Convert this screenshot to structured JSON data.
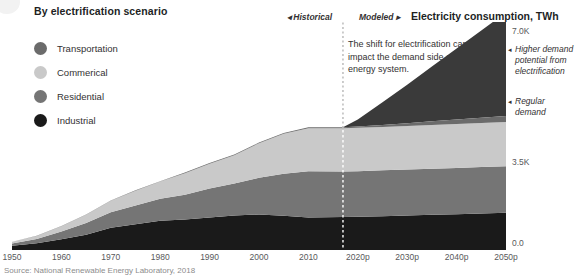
{
  "legend": {
    "title": "By electrification scenario",
    "items": [
      {
        "label": "Transportation",
        "color": "#6b6b6b"
      },
      {
        "label": "Commerical",
        "color": "#c9c9c9"
      },
      {
        "label": "Residential",
        "color": "#757575"
      },
      {
        "label": "Industrial",
        "color": "#1a1a1a"
      }
    ]
  },
  "periods": {
    "historical": "◂ Historical",
    "modeled": "Modeled ▸"
  },
  "chart_title": "Electricity consumption, TWh",
  "callout": "The shift for electrification can impact the demand side of the U.S. energy system.",
  "annotations": {
    "higher_arrow": "◂",
    "higher": "Higher demand potential from electrification",
    "regular_arrow": "◂",
    "regular": "Regular demand"
  },
  "source": "Source: National Renewable Energy Laboratory, 2018",
  "chart_data": {
    "type": "area",
    "title": "Electricity consumption, TWh",
    "xlabel": "",
    "ylabel": "Electricity consumption, TWh",
    "ylim": [
      0,
      7000
    ],
    "xlim": [
      1950,
      2050
    ],
    "grid": false,
    "legend_position": "top-left",
    "ytick_labels": [
      "0.0",
      "3.5K",
      "7.0K"
    ],
    "ytick_values": [
      0,
      3500,
      7000
    ],
    "xtick_labels": [
      "1950",
      "1960",
      "1970",
      "1980",
      "1990",
      "2000",
      "2010",
      "2020p",
      "2030p",
      "2040p",
      "2050p"
    ],
    "xtick_values": [
      1950,
      1960,
      1970,
      1980,
      1990,
      2000,
      2010,
      2020,
      2030,
      2040,
      2050
    ],
    "divider_year": 2017,
    "divider_label": "Historical / Modeled",
    "stack_order": [
      "Industrial",
      "Residential",
      "Commerical",
      "Transportation"
    ],
    "x": [
      1950,
      1955,
      1960,
      1965,
      1970,
      1975,
      1980,
      1985,
      1990,
      1995,
      2000,
      2005,
      2010,
      2017,
      2020,
      2025,
      2030,
      2035,
      2040,
      2045,
      2050
    ],
    "series": [
      {
        "name": "Industrial",
        "color": "#1a1a1a",
        "values": [
          130,
          210,
          330,
          470,
          680,
          790,
          900,
          940,
          1000,
          1060,
          1090,
          1050,
          1000,
          1010,
          1020,
          1040,
          1060,
          1080,
          1100,
          1120,
          1140
        ]
      },
      {
        "name": "Residential",
        "color": "#757575",
        "values": [
          70,
          130,
          240,
          360,
          480,
          580,
          670,
          760,
          890,
          980,
          1130,
          1290,
          1420,
          1400,
          1400,
          1405,
          1410,
          1415,
          1420,
          1425,
          1430
        ]
      },
      {
        "name": "Commerical",
        "color": "#c9c9c9",
        "values": [
          50,
          90,
          160,
          250,
          350,
          450,
          530,
          660,
          760,
          870,
          1060,
          1230,
          1320,
          1330,
          1330,
          1335,
          1340,
          1345,
          1350,
          1355,
          1360
        ]
      },
      {
        "name": "Transportation",
        "color": "#6b6b6b",
        "values": [
          5,
          6,
          7,
          8,
          10,
          12,
          14,
          16,
          18,
          20,
          22,
          24,
          26,
          30,
          40,
          60,
          85,
          110,
          135,
          160,
          185
        ]
      },
      {
        "name": "Higher demand potential from electrification",
        "color": "#3a3a3a",
        "values": [
          0,
          0,
          0,
          0,
          0,
          0,
          0,
          0,
          0,
          0,
          0,
          0,
          0,
          0,
          220,
          700,
          1180,
          1680,
          2180,
          2680,
          3180
        ]
      }
    ]
  }
}
